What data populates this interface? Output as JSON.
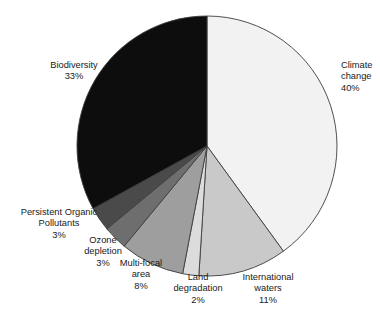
{
  "title": {
    "text": "",
    "visible": false
  },
  "chart_data": {
    "type": "pie",
    "title": "",
    "subtitle": "",
    "xlabel": "",
    "ylabel": "",
    "legend_position": "none",
    "grid": false,
    "units": "percent",
    "start_angle_deg": 0,
    "direction": "clockwise",
    "labels": [
      "Climate change",
      "International waters",
      "Land degradation",
      "Multi-focal area",
      "Ozone depletion",
      "Persistent Organic Pollutants",
      "Biodiversity"
    ],
    "values": [
      40,
      11,
      2,
      8,
      3,
      3,
      33
    ],
    "value_labels": [
      "40%",
      "11%",
      "2%",
      "8%",
      "3%",
      "3%",
      "33%"
    ],
    "colors": [
      "#f2f2f2",
      "#c9c9c9",
      "#dcdcdc",
      "#9e9e9e",
      "#6e6e6e",
      "#4a4a4a",
      "#0d0d0d"
    ],
    "slices": [
      {
        "name": "climate-change",
        "label_line1": "Climate",
        "label_line2": "change",
        "percent_label": "40%",
        "value": 40,
        "color": "#f2f2f2"
      },
      {
        "name": "international-waters",
        "label_line1": "International",
        "label_line2": "waters",
        "percent_label": "11%",
        "value": 11,
        "color": "#c9c9c9"
      },
      {
        "name": "land-degradation",
        "label_line1": "Land",
        "label_line2": "degradation",
        "percent_label": "2%",
        "value": 2,
        "color": "#dcdcdc"
      },
      {
        "name": "multi-focal-area",
        "label_line1": "Multi-focal",
        "label_line2": "area",
        "percent_label": "8%",
        "value": 8,
        "color": "#9e9e9e"
      },
      {
        "name": "ozone-depletion",
        "label_line1": "Ozone",
        "label_line2": "depletion",
        "percent_label": "3%",
        "value": 3,
        "color": "#6e6e6e"
      },
      {
        "name": "persistent-organic-pollutants",
        "label_line1": "Persistent Organic",
        "label_line2": "Pollutants",
        "percent_label": "3%",
        "value": 3,
        "color": "#4a4a4a"
      },
      {
        "name": "biodiversity",
        "label_line1": "Biodiversity",
        "label_line2": "",
        "percent_label": "33%",
        "value": 33,
        "color": "#0d0d0d"
      }
    ]
  },
  "style": {
    "outline_color": "#3d3d3d",
    "background": "#ffffff",
    "text_color": "#1a1a1a"
  }
}
